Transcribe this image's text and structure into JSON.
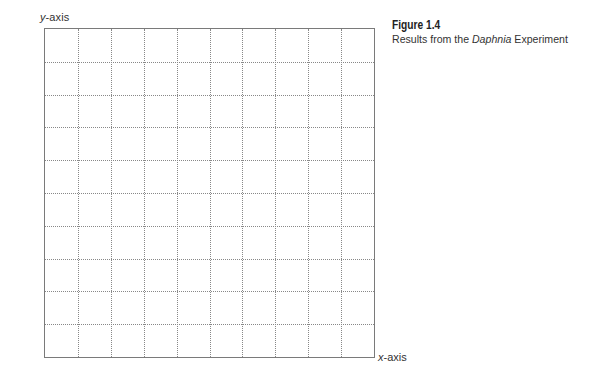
{
  "chart_data": {
    "type": "scatter",
    "title": "Figure 1.4",
    "subtitle": "Results from the Daphnia Experiment",
    "xlabel": "x-axis",
    "ylabel": "y-axis",
    "grid": true,
    "grid_style": "dotted",
    "grid_columns": 10,
    "grid_rows": 10,
    "series": [],
    "categories": [],
    "values": [],
    "legend": null,
    "note": "Blank graph grid with no plotted data or tick labels"
  },
  "axes": {
    "y_label_prefix": "y",
    "y_label_suffix": "-axis",
    "x_label_prefix": "x",
    "x_label_suffix": "-axis"
  },
  "caption": {
    "figure_label": "Figure 1.4",
    "text_before": "Results from the ",
    "text_italic": "Daphnia",
    "text_after": " Experiment"
  },
  "colors": {
    "border": "#7a7a7a",
    "gridline": "#888888",
    "text": "#333333",
    "background": "#ffffff"
  }
}
